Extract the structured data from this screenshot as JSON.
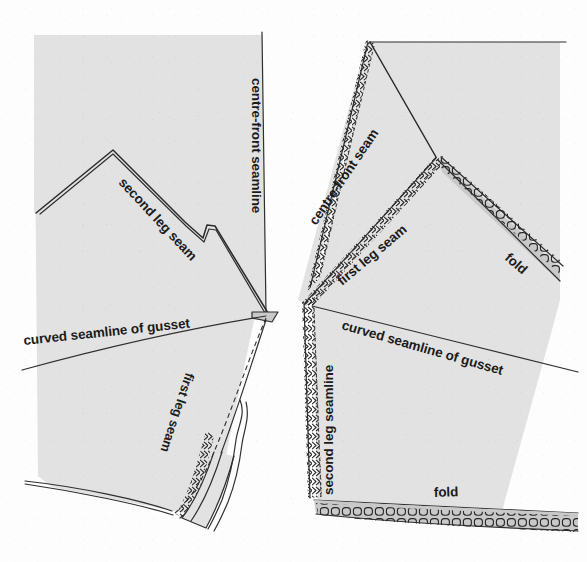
{
  "figure": {
    "kind": "sewing-pattern-technical-illustration",
    "background_color": "#fdfdfd",
    "fabric_fill_color": "#e2e2e2",
    "fabric_shadow_color": "#c9c9c9",
    "ink_color": "#262626",
    "panels": [
      {
        "id": "left-panel",
        "name": "flat-pattern-piece-left",
        "description": "Pattern piece shown flat with seam allowance turned, centre-front seamline at right edge",
        "labels": [
          {
            "id": "l1",
            "name": "centre-front-seamline-label",
            "text": "centre-front seamline",
            "rotation_deg": 90,
            "x": 252,
            "y": 78
          },
          {
            "id": "l2",
            "name": "second-leg-seam-label",
            "text": "second leg seam",
            "rotation_deg": 47,
            "x": 118,
            "y": 183
          },
          {
            "id": "l3",
            "name": "curved-seamline-of-gusset-label",
            "text": "curved seamline of gusset",
            "rotation_deg": -6,
            "x": 24,
            "y": 345
          },
          {
            "id": "l4",
            "name": "first-leg-seam-label",
            "text": "first leg seam",
            "rotation_deg": -108,
            "x": 186,
            "y": 372
          }
        ]
      },
      {
        "id": "right-panel",
        "name": "folded-pattern-piece-right",
        "description": "Same piece folded with overlocked seam allowances and folds marked",
        "labels": [
          {
            "id": "r1",
            "name": "centre-front-seam-label",
            "text": "centre-front seam",
            "rotation_deg": 56,
            "x": 316,
            "y": 226
          },
          {
            "id": "r2",
            "name": "first-leg-seam-label",
            "text": "first leg seam",
            "rotation_deg": 40,
            "x": 342,
            "y": 286
          },
          {
            "id": "r3",
            "name": "fold-label-upper",
            "text": "fold",
            "rotation_deg": 34,
            "x": 504,
            "y": 259
          },
          {
            "id": "r4",
            "name": "second-leg-seamline-label",
            "text": "second leg seamline",
            "rotation_deg": -90,
            "x": 333,
            "y": 495
          },
          {
            "id": "r5",
            "name": "curved-seamline-of-gusset-label",
            "text": "curved seamline of gusset",
            "rotation_deg": 16,
            "x": 341,
            "y": 329
          },
          {
            "id": "r6",
            "name": "fold-label-lower",
            "text": "fold",
            "rotation_deg": -2,
            "x": 434,
            "y": 497
          }
        ]
      }
    ],
    "legend_terms": [
      "centre-front seamline",
      "centre-front seam",
      "second leg seam",
      "second leg seamline",
      "first leg seam",
      "curved seamline of gusset",
      "fold"
    ]
  }
}
